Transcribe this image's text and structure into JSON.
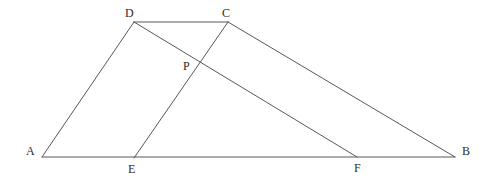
{
  "figure": {
    "type": "plane-geometry-diagram",
    "background_color": "#ffffff",
    "stroke_color": "#585858",
    "stroke_width": 1,
    "label_color": "#2b2b2b",
    "label_font_size": 12,
    "width": 485,
    "height": 179,
    "points": [
      {
        "name": "A",
        "x": 42,
        "y": 157,
        "label": "A",
        "label_x": 26,
        "label_y": 145
      },
      {
        "name": "B",
        "x": 455,
        "y": 157,
        "label": "B",
        "label_x": 462,
        "label_y": 145
      },
      {
        "name": "C",
        "x": 228,
        "y": 22,
        "label": "C",
        "label_x": 222,
        "label_y": 7
      },
      {
        "name": "D",
        "x": 134,
        "y": 22,
        "label": "D",
        "label_x": 125,
        "label_y": 7
      },
      {
        "name": "E",
        "x": 134,
        "y": 158,
        "label": "E",
        "label_x": 128,
        "label_y": 163
      },
      {
        "name": "F",
        "x": 357,
        "y": 157,
        "label": "F",
        "label_x": 354,
        "label_y": 162
      },
      {
        "name": "P",
        "x": 199,
        "y": 66,
        "label": "P",
        "label_x": 183,
        "label_y": 60
      }
    ],
    "segments": [
      {
        "name": "AD",
        "from": "A",
        "to": "D",
        "x1": 42,
        "y1": 157,
        "x2": 134,
        "y2": 22
      },
      {
        "name": "DC",
        "from": "D",
        "to": "C",
        "x1": 134,
        "y1": 22,
        "x2": 228,
        "y2": 22
      },
      {
        "name": "CB",
        "from": "C",
        "to": "B",
        "x1": 228,
        "y1": 22,
        "x2": 455,
        "y2": 157
      },
      {
        "name": "AB",
        "from": "A",
        "to": "B",
        "x1": 42,
        "y1": 157,
        "x2": 455,
        "y2": 157
      },
      {
        "name": "DF",
        "from": "D",
        "to": "F",
        "x1": 134,
        "y1": 22,
        "x2": 357,
        "y2": 157
      },
      {
        "name": "EC",
        "from": "E",
        "to": "C",
        "x1": 134,
        "y1": 158,
        "x2": 228,
        "y2": 22
      }
    ]
  }
}
